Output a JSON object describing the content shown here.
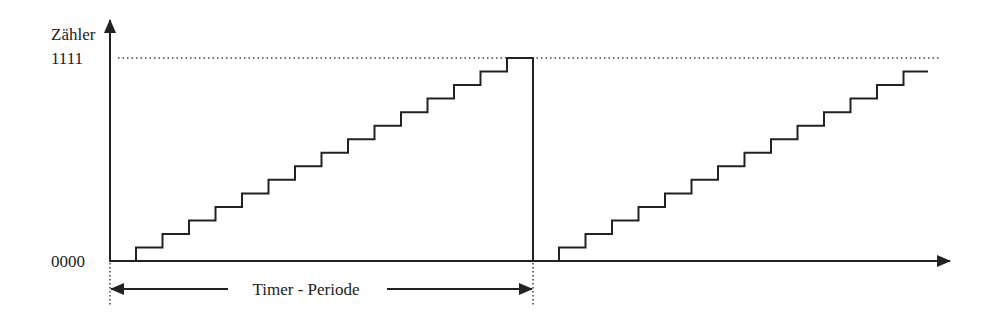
{
  "diagram": {
    "type": "timing-diagram",
    "y_axis": {
      "label": "Zähler",
      "top_value_label": "1111",
      "bottom_value_label": "0000"
    },
    "period": {
      "label": "Timer - Periode"
    },
    "ramps": [
      {
        "name": "ramp-1",
        "start_x": 136,
        "steps": 15,
        "end_x": 533,
        "drops_to_zero": true
      },
      {
        "name": "ramp-2",
        "start_x": 559,
        "steps": 14,
        "end_x": 928,
        "drops_to_zero": false
      }
    ],
    "geometry": {
      "axis_x": 110,
      "baseline_y": 261,
      "top_y": 58,
      "step_width": 26.5,
      "step_height": 13.53,
      "axis_end_x": 950,
      "dotted_end_x": 940,
      "period_arrow_y": 289,
      "period_start_x": 110,
      "period_end_x": 533
    },
    "colors": {
      "line": "#222222",
      "dotted": "#444444",
      "background": "#ffffff"
    }
  }
}
